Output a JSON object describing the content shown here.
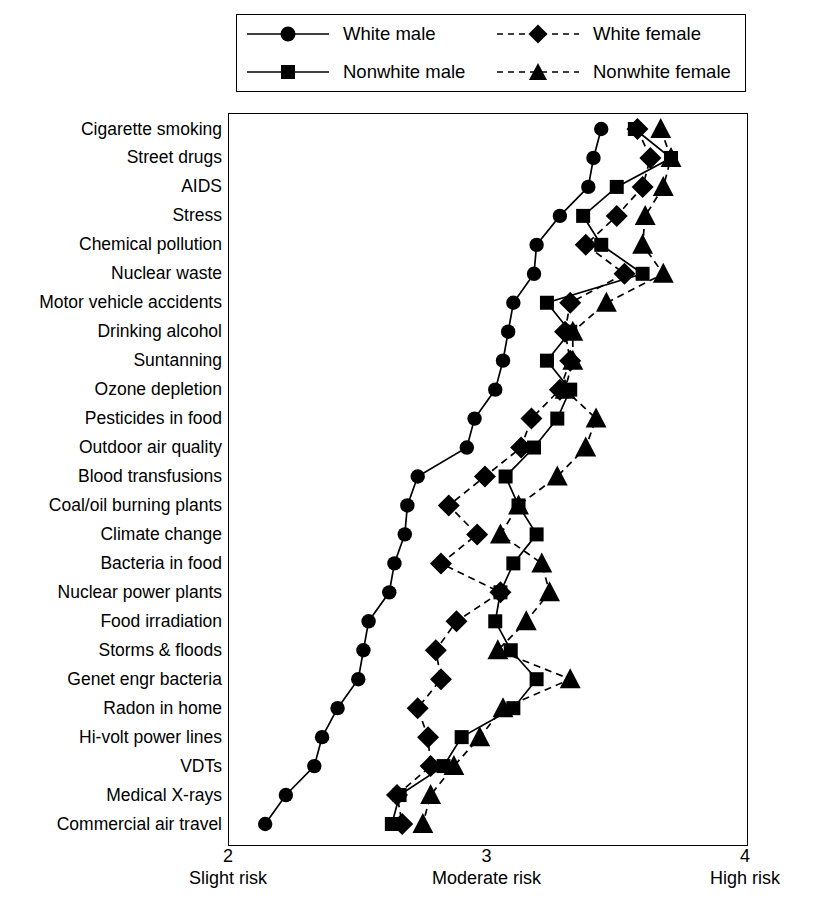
{
  "chart_data": {
    "type": "line",
    "title": "",
    "subtitle": "",
    "xlabel": "",
    "ylabel": "",
    "xlim": [
      2,
      4
    ],
    "grid": false,
    "legend_position": "top",
    "orientation": "horizontal-categories",
    "xticks": [
      {
        "value": 2,
        "num": "2",
        "caption": "Slight risk"
      },
      {
        "value": 3,
        "num": "3",
        "caption": "Moderate risk"
      },
      {
        "value": 4,
        "num": "4",
        "caption": "High risk"
      }
    ],
    "categories": [
      "Cigarette smoking",
      "Street drugs",
      "AIDS",
      "Stress",
      "Chemical pollution",
      "Nuclear waste",
      "Motor vehicle accidents",
      "Drinking alcohol",
      "Suntanning",
      "Ozone depletion",
      "Pesticides in food",
      "Outdoor air quality",
      "Blood transfusions",
      "Coal/oil burning plants",
      "Climate change",
      "Bacteria in food",
      "Nuclear power plants",
      "Food irradiation",
      "Storms & floods",
      "Genet engr bacteria",
      "Radon in home",
      "Hi-volt power lines",
      "VDTs",
      "Medical X-rays",
      "Commercial air travel"
    ],
    "series": [
      {
        "name": "White male",
        "marker": "circle",
        "line": "solid",
        "values": [
          3.44,
          3.41,
          3.39,
          3.28,
          3.19,
          3.18,
          3.1,
          3.08,
          3.06,
          3.03,
          2.95,
          2.92,
          2.73,
          2.69,
          2.68,
          2.64,
          2.62,
          2.54,
          2.52,
          2.5,
          2.42,
          2.36,
          2.33,
          2.22,
          2.14
        ]
      },
      {
        "name": "Nonwhite male",
        "marker": "square",
        "line": "solid",
        "values": [
          3.57,
          3.71,
          3.5,
          3.37,
          3.44,
          3.6,
          3.23,
          3.32,
          3.23,
          3.32,
          3.27,
          3.18,
          3.07,
          3.12,
          3.19,
          3.1,
          3.05,
          3.03,
          3.09,
          3.19,
          3.1,
          2.9,
          2.83,
          2.66,
          2.63
        ]
      },
      {
        "name": "White female",
        "marker": "diamond",
        "line": "dashed",
        "values": [
          3.58,
          3.63,
          3.6,
          3.5,
          3.38,
          3.53,
          3.32,
          3.3,
          3.32,
          3.28,
          3.17,
          3.13,
          2.99,
          2.85,
          2.96,
          2.82,
          3.05,
          2.88,
          2.8,
          2.82,
          2.73,
          2.77,
          2.78,
          2.65,
          2.67
        ]
      },
      {
        "name": "Nonwhite female",
        "marker": "triangle",
        "line": "dashed",
        "values": [
          3.67,
          3.71,
          3.68,
          3.61,
          3.6,
          3.68,
          3.46,
          3.33,
          3.33,
          3.3,
          3.42,
          3.38,
          3.27,
          3.12,
          3.05,
          3.21,
          3.24,
          3.15,
          3.04,
          3.32,
          3.06,
          2.97,
          2.87,
          2.78,
          2.75
        ]
      }
    ],
    "legend": [
      {
        "name": "White male",
        "marker": "circle",
        "line": "solid"
      },
      {
        "name": "White female",
        "marker": "diamond",
        "line": "dashed"
      },
      {
        "name": "Nonwhite male",
        "marker": "square",
        "line": "solid"
      },
      {
        "name": "Nonwhite female",
        "marker": "triangle",
        "line": "dashed"
      }
    ],
    "colors": {
      "series": "#000000",
      "axis": "#000000",
      "background": "#ffffff"
    }
  }
}
